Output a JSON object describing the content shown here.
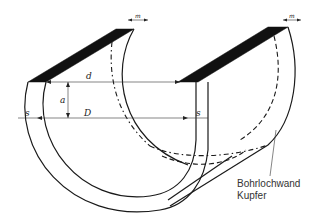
{
  "diagram": {
    "type": "technical-drawing",
    "labels": {
      "d": "d",
      "a": "a",
      "D": "D",
      "s_left": "s",
      "s_right": "s",
      "m_left": "m",
      "m_right": "m"
    },
    "callout": {
      "line1": "Bohrlochwand",
      "line2": "Kupfer"
    },
    "colors": {
      "line": "#1a1a1a",
      "background": "#ffffff",
      "text": "#333333"
    }
  }
}
